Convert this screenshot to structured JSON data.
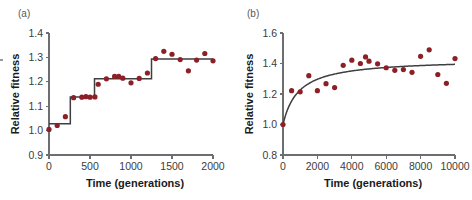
{
  "figure": {
    "background_color": "#ffffff",
    "marker_color": "#8c2026",
    "line_color": "#3f3f41",
    "axis_color": "#6d6e71"
  },
  "panels": [
    {
      "id": "a",
      "label": "(a)",
      "chart_data": {
        "type": "scatter",
        "title": "",
        "xlabel": "Time (generations)",
        "ylabel": "Relative fitness",
        "xlim": [
          0,
          2000
        ],
        "ylim": [
          0.9,
          1.4
        ],
        "xticks": [
          0,
          500,
          1000,
          1500,
          2000
        ],
        "xtick_labels": [
          "0",
          "500",
          "1000",
          "1500",
          "2000"
        ],
        "yticks": [
          0.9,
          1.0,
          1.1,
          1.2,
          1.3,
          1.4
        ],
        "ytick_labels": [
          "0.9",
          "1.0",
          "1.1",
          "1.2",
          "1.3",
          "1.4"
        ],
        "grid": false,
        "legend": "none",
        "series": [
          {
            "name": "Relative fitness measurements",
            "marker": "circle",
            "color": "#8c2026",
            "points": [
              [
                0,
                1.005
              ],
              [
                100,
                1.021
              ],
              [
                200,
                1.057
              ],
              [
                300,
                1.135
              ],
              [
                400,
                1.137
              ],
              [
                450,
                1.139
              ],
              [
                500,
                1.137
              ],
              [
                560,
                1.138
              ],
              [
                600,
                1.19
              ],
              [
                700,
                1.212
              ],
              [
                800,
                1.222
              ],
              [
                850,
                1.222
              ],
              [
                900,
                1.215
              ],
              [
                1000,
                1.196
              ],
              [
                1100,
                1.214
              ],
              [
                1200,
                1.236
              ],
              [
                1300,
                1.295
              ],
              [
                1400,
                1.325
              ],
              [
                1500,
                1.313
              ],
              [
                1600,
                1.291
              ],
              [
                1700,
                1.245
              ],
              [
                1800,
                1.289
              ],
              [
                1900,
                1.316
              ],
              [
                2000,
                1.286
              ]
            ]
          },
          {
            "name": "Step fit",
            "marker": "none",
            "color": "#3f3f41",
            "step_levels": [
              {
                "x_start": 0,
                "x_end": 260,
                "y": 1.028
              },
              {
                "x_start": 260,
                "x_end": 555,
                "y": 1.138
              },
              {
                "x_start": 555,
                "x_end": 1250,
                "y": 1.213
              },
              {
                "x_start": 1250,
                "x_end": 2000,
                "y": 1.293
              }
            ]
          }
        ]
      }
    },
    {
      "id": "b",
      "label": "(b)",
      "chart_data": {
        "type": "scatter",
        "title": "",
        "xlabel": "Time (generations)",
        "ylabel": "Relative fitness",
        "xlim": [
          0,
          10000
        ],
        "ylim": [
          0.8,
          1.6
        ],
        "xticks": [
          0,
          2000,
          4000,
          6000,
          8000,
          10000
        ],
        "xtick_labels": [
          "0",
          "2000",
          "4000",
          "6000",
          "8000",
          "10000"
        ],
        "yticks": [
          0.8,
          1.0,
          1.2,
          1.4,
          1.6
        ],
        "ytick_labels": [
          "0.8",
          "1.0",
          "1.2",
          "1.4",
          "1.6"
        ],
        "grid": false,
        "legend": "none",
        "series": [
          {
            "name": "Relative fitness measurements",
            "marker": "circle",
            "color": "#8c2026",
            "points": [
              [
                0,
                1.0
              ],
              [
                500,
                1.222
              ],
              [
                1000,
                1.214
              ],
              [
                1500,
                1.32
              ],
              [
                2000,
                1.222
              ],
              [
                2500,
                1.268
              ],
              [
                3000,
                1.242
              ],
              [
                3500,
                1.388
              ],
              [
                4000,
                1.422
              ],
              [
                4500,
                1.4
              ],
              [
                4800,
                1.443
              ],
              [
                5000,
                1.415
              ],
              [
                5500,
                1.398
              ],
              [
                6000,
                1.372
              ],
              [
                6500,
                1.355
              ],
              [
                7000,
                1.36
              ],
              [
                7500,
                1.342
              ],
              [
                8000,
                1.447
              ],
              [
                8500,
                1.49
              ],
              [
                9000,
                1.328
              ],
              [
                9500,
                1.27
              ],
              [
                10000,
                1.432
              ]
            ]
          },
          {
            "name": "Hyperbolic fit",
            "marker": "none",
            "color": "#3f3f41",
            "curve_note": "rises steeply from 1.0 at x=0 and saturates near 1.40"
          }
        ]
      }
    }
  ]
}
